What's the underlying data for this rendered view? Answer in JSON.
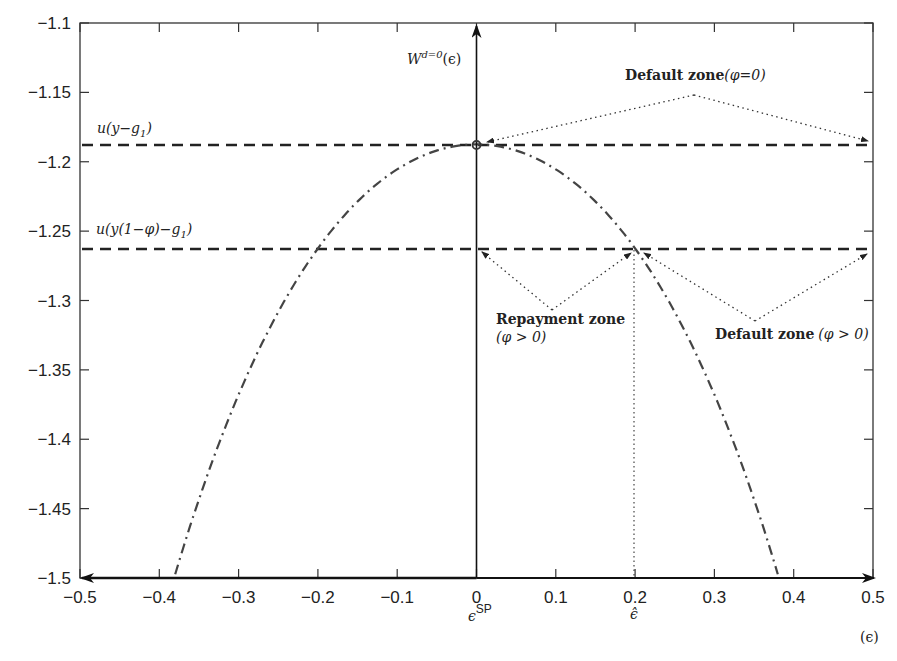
{
  "chart_data": {
    "type": "line",
    "title": "",
    "xlabel": "(ϵ)",
    "ylabel": "W^{d=0}(ϵ)",
    "xlim": [
      -0.5,
      0.5
    ],
    "ylim": [
      -1.5,
      -1.1
    ],
    "grid": false,
    "x_ticks": [
      "-0.5",
      "-0.4",
      "-0.3",
      "-0.2",
      "-0.1",
      "0",
      "0.1",
      "0.2",
      "0.3",
      "0.4",
      "0.5"
    ],
    "y_ticks": [
      "-1.1",
      "-1.15",
      "-1.2",
      "-1.25",
      "-1.3",
      "-1.35",
      "-1.4",
      "-1.45",
      "-1.5"
    ],
    "series": [
      {
        "name": "W^{d=0}(ϵ)",
        "style": "dash-dot",
        "x": [
          -0.38,
          -0.3,
          -0.2,
          -0.1,
          0,
          0.1,
          0.2,
          0.3,
          0.38
        ],
        "values": [
          -1.496,
          -1.368,
          -1.262,
          -1.205,
          -1.1875,
          -1.205,
          -1.262,
          -1.368,
          -1.496
        ]
      },
      {
        "name": "u(y - g1)",
        "style": "dashed",
        "x": [
          -0.5,
          0.5
        ],
        "values": [
          -1.1875,
          -1.1875
        ]
      },
      {
        "name": "u(y(1-φ) - g1)",
        "style": "dashed",
        "x": [
          -0.5,
          0.5
        ],
        "values": [
          -1.2625,
          -1.2625
        ]
      }
    ],
    "annotations": [
      {
        "text": "u(y−g₁)",
        "x": -0.47,
        "y": -1.175
      },
      {
        "text": "u(y(1−φ)−g₁)",
        "x": -0.47,
        "y": -1.25
      },
      {
        "text": "W^{d=0}(ϵ)",
        "x": 0.005,
        "y": -1.125
      },
      {
        "text": "Default zone(φ=0)",
        "x": 0.28,
        "y": -1.145
      },
      {
        "text": "Repayment zone (φ > 0)",
        "x": 0.06,
        "y": -1.31
      },
      {
        "text": "Default zone (φ > 0)",
        "x": 0.4,
        "y": -1.325
      },
      {
        "text": "ϵ^{SP}",
        "x": 0.0,
        "y": "below axis"
      },
      {
        "text": "ϵ̂",
        "x": 0.2,
        "y": "below axis"
      },
      {
        "text": "(ϵ)",
        "x": 0.49,
        "y": "below axis"
      }
    ],
    "markers": [
      {
        "name": "peak",
        "x": 0,
        "y": -1.1875,
        "shape": "circle"
      },
      {
        "name": "epsilon-hat-vline",
        "x": 0.2,
        "from_y": -1.2625,
        "to_y": -1.5,
        "style": "dotted"
      }
    ]
  },
  "labels": {
    "x_ticks": [
      "−0.5",
      "−0.4",
      "−0.3",
      "−0.2",
      "−0.1",
      "0",
      "0.1",
      "0.2",
      "0.3",
      "0.4",
      "0.5"
    ],
    "y_ticks": [
      "−1.1",
      "−1.15",
      "−1.2",
      "−1.25",
      "−1.3",
      "−1.35",
      "−1.4",
      "−1.45",
      "−1.5"
    ],
    "upper_line_label": "u(y−g",
    "upper_line_sub": "1",
    "upper_line_close": ")",
    "lower_line_label": "u(y(1−φ)−g",
    "lower_line_sub": "1",
    "lower_line_close": ")",
    "w_label": "W",
    "w_sup": "d=0",
    "w_arg": "(ϵ)",
    "default_zone_top_bold": "Default zone",
    "default_zone_top_math": "(φ=0)",
    "repayment_zone_bold": "Repayment zone",
    "repayment_zone_math": "(φ > 0)",
    "default_zone_right_bold": "Default zone",
    "default_zone_right_math": "(φ > 0)",
    "eps_sp": "ϵ",
    "eps_sp_sup": "SP",
    "eps_hat": "ϵ̂",
    "x_axis_label": "(ϵ)"
  },
  "colors": {
    "ink": "#222222",
    "curve": "#444444",
    "background": "#ffffff"
  }
}
